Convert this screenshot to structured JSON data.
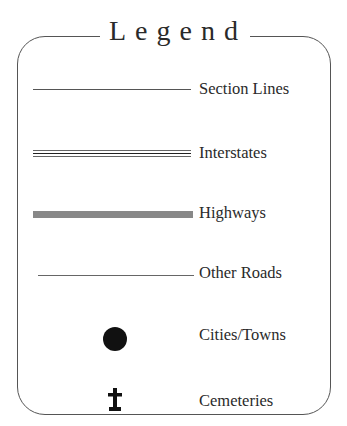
{
  "legend": {
    "title": "Legend",
    "items": [
      {
        "label": "Section Lines",
        "symbol": "thin-line-icon"
      },
      {
        "label": "Interstates",
        "symbol": "triple-line-icon"
      },
      {
        "label": "Highways",
        "symbol": "thick-gray-line-icon"
      },
      {
        "label": "Other Roads",
        "symbol": "hairline-icon"
      },
      {
        "label": "Cities/Towns",
        "symbol": "filled-circle-icon"
      },
      {
        "label": "Cemeteries",
        "symbol": "cross-tombstone-icon"
      }
    ]
  }
}
